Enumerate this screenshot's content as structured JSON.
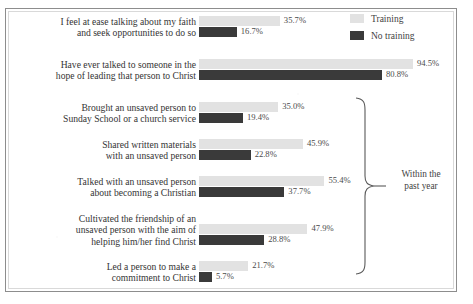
{
  "legend": {
    "items": [
      {
        "label": "Training",
        "color": "#e2e2e2",
        "icon": "square-swatch-icon"
      },
      {
        "label": "No training",
        "color": "#3a3a3a",
        "icon": "square-swatch-icon"
      }
    ]
  },
  "annotation": {
    "brace_label_line1": "Within the",
    "brace_label_line2": "past year"
  },
  "chart_data": {
    "type": "bar",
    "orientation": "horizontal",
    "title": "",
    "xlabel": "",
    "ylabel": "",
    "xlim": [
      0,
      100
    ],
    "grid": false,
    "legend_position": "top-right",
    "value_suffix": "%",
    "categories": [
      "I feel at ease talking about my faith and seek opportunities to do so",
      "Have ever talked to someone in the hope of leading that person to Christ",
      "Brought an unsaved person to Sunday School or a church service",
      "Shared written materials with an unsaved person",
      "Talked with an unsaved person about becoming a Christian",
      "Cultivated the friendship of an unsaved person with the aim of helping him/her find Christ",
      "Led a person to make a commitment to Christ"
    ],
    "series": [
      {
        "name": "Training",
        "color": "#e2e2e2",
        "values": [
          35.7,
          94.5,
          35.0,
          45.9,
          55.4,
          47.9,
          21.7
        ],
        "labels": [
          "35.7%",
          "94.5%",
          "35.0%",
          "45.9%",
          "55.4%",
          "47.9%",
          "21.7%"
        ]
      },
      {
        "name": "No training",
        "color": "#3a3a3a",
        "values": [
          16.7,
          80.8,
          19.4,
          22.8,
          37.7,
          28.8,
          5.7
        ],
        "labels": [
          "16.7%",
          "80.8%",
          "19.4%",
          "22.8%",
          "37.7%",
          "28.8%",
          "5.7%"
        ]
      }
    ],
    "annotations": [
      {
        "text": "Within the past year",
        "type": "brace",
        "covers_categories": [
          2,
          3,
          4,
          5,
          6
        ]
      }
    ]
  },
  "groups": [
    {
      "label_lines": [
        "I feel at ease talking about my faith",
        "and seek opportunities to do so"
      ],
      "top": 16,
      "training": 35.7,
      "no_training": 16.7,
      "training_label": "35.7%",
      "no_training_label": "16.7%"
    },
    {
      "label_lines": [
        "Have ever talked to someone in the",
        "hope of leading that person to Christ"
      ],
      "top": 59,
      "training": 94.5,
      "no_training": 80.8,
      "training_label": "94.5%",
      "no_training_label": "80.8%"
    },
    {
      "label_lines": [
        "Brought an unsaved person to",
        "Sunday School or a church service"
      ],
      "top": 102,
      "training": 35.0,
      "no_training": 19.4,
      "training_label": "35.0%",
      "no_training_label": "19.4%"
    },
    {
      "label_lines": [
        "Shared written materials",
        "with an unsaved person"
      ],
      "top": 139,
      "training": 45.9,
      "no_training": 22.8,
      "training_label": "45.9%",
      "no_training_label": "22.8%"
    },
    {
      "label_lines": [
        "Talked with an unsaved person",
        "about becoming a Christian"
      ],
      "top": 176,
      "training": 55.4,
      "no_training": 37.7,
      "training_label": "55.4%",
      "no_training_label": "37.7%"
    },
    {
      "label_lines": [
        "Cultivated the friendship of an",
        "unsaved person with the aim of",
        "helping him/her find Christ"
      ],
      "top": 213,
      "training": 47.9,
      "no_training": 28.8,
      "training_label": "47.9%",
      "no_training_label": "28.8%"
    },
    {
      "label_lines": [
        "Led a person to make a",
        "commitment to Christ"
      ],
      "top": 261,
      "training": 21.7,
      "no_training": 5.7,
      "training_label": "21.7%",
      "no_training_label": "5.7%"
    }
  ]
}
